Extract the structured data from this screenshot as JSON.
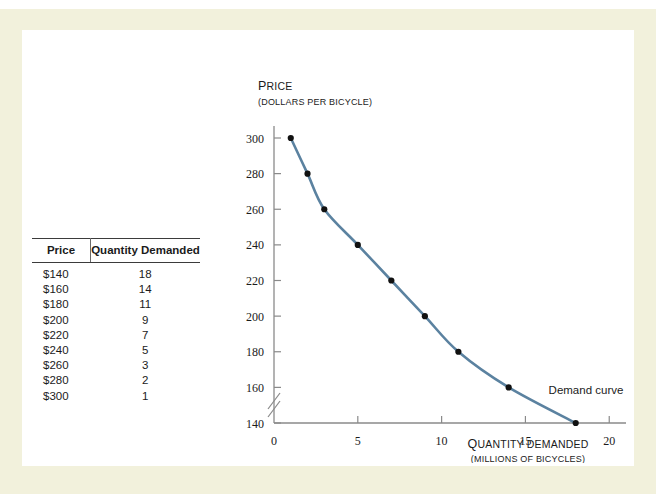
{
  "page": {
    "background_color": "#f2f1dc",
    "panel_color": "#ffffff",
    "running_head": ""
  },
  "table": {
    "columns": [
      "Price",
      "Quantity Demanded"
    ],
    "rows": [
      {
        "price": "$140",
        "quantity": "18"
      },
      {
        "price": "$160",
        "quantity": "14"
      },
      {
        "price": "$180",
        "quantity": "11"
      },
      {
        "price": "$200",
        "quantity": "9"
      },
      {
        "price": "$220",
        "quantity": "7"
      },
      {
        "price": "$240",
        "quantity": "5"
      },
      {
        "price": "$260",
        "quantity": "3"
      },
      {
        "price": "$280",
        "quantity": "2"
      },
      {
        "price": "$300",
        "quantity": "1"
      }
    ]
  },
  "chart_data": {
    "type": "line",
    "title": "",
    "ylabel": "PRICE",
    "ylabel_caps": "P",
    "ylabel_rest": "RICE",
    "ylabel_sub": "(DOLLARS PER BICYCLE)",
    "xlabel": "QUANTITY DEMANDED",
    "xlabel_caps": "Q",
    "xlabel_rest": "UANTITY DEMANDED",
    "xlabel_sub": "(MILLIONS OF BICYCLES)",
    "series_name": "Demand curve",
    "annotation": "Demand curve",
    "line_color": "#5b82a0",
    "marker_color": "#111111",
    "axis_color": "#8a8a8a",
    "x": [
      1,
      2,
      3,
      5,
      7,
      9,
      11,
      14,
      18
    ],
    "y": [
      300,
      280,
      260,
      240,
      220,
      200,
      180,
      160,
      140
    ],
    "xticks": [
      "0",
      "5",
      "10",
      "15",
      "20"
    ],
    "xtick_values": [
      0,
      5,
      10,
      15,
      20
    ],
    "yticks": [
      "140",
      "160",
      "180",
      "200",
      "220",
      "240",
      "260",
      "280",
      "300"
    ],
    "ytick_values": [
      140,
      160,
      180,
      200,
      220,
      240,
      260,
      280,
      300
    ],
    "xlim": [
      0,
      21
    ],
    "ylim": [
      140,
      300
    ],
    "grid": false,
    "axis_break": true,
    "legend": "none"
  }
}
